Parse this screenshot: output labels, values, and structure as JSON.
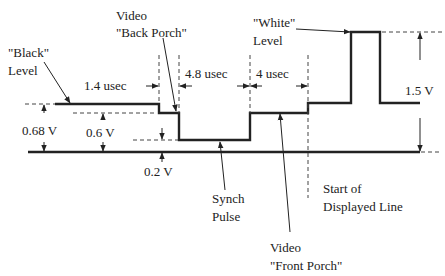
{
  "diagram": {
    "labels": {
      "black_level_line1": "\"Black\"",
      "black_level_line2": "Level",
      "back_porch_line1": "Video",
      "back_porch_line2": "\"Back Porch\"",
      "white_level_line1": "\"White\"",
      "white_level_line2": "Level",
      "sync_pulse_line1": "Synch",
      "sync_pulse_line2": "Pulse",
      "front_porch_line1": "Video",
      "front_porch_line2": "\"Front Porch\"",
      "start_line1": "Start of",
      "start_line2": "Displayed Line"
    },
    "timings": {
      "front_porch": "1.4 usec",
      "sync_width": "4.8 usec",
      "back_porch": "4 usec"
    },
    "voltages": {
      "black_level": "0.68 V",
      "porch_level": "0.6 V",
      "sync_level": "0.2 V",
      "white_level": "1.5 V"
    },
    "colors": {
      "line": "#222222",
      "background": "#ffffff"
    }
  }
}
